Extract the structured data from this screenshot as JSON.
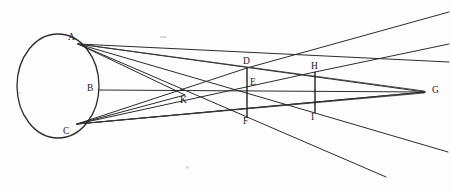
{
  "figure": {
    "type": "optical-ray-diagram",
    "background_color": "#fdfdfd",
    "ink_color": "#2b2b2b",
    "width": 451,
    "height": 190
  },
  "sphere": {
    "label": "luminous-sphere",
    "center_x": 58,
    "center_y": 86,
    "radius_x": 41,
    "radius_y": 52
  },
  "points": [
    {
      "id": "A",
      "label": "A",
      "x": 78,
      "y": 44,
      "label_x": 68,
      "label_y": 33
    },
    {
      "id": "B",
      "label": "B",
      "x": 98,
      "y": 90,
      "label_x": 87,
      "label_y": 84
    },
    {
      "id": "C",
      "label": "C",
      "x": 77,
      "y": 124,
      "label_x": 63,
      "label_y": 127
    },
    {
      "id": "K",
      "label": "K",
      "x": 185,
      "y": 95,
      "label_x": 180,
      "label_y": 96
    },
    {
      "id": "D",
      "label": "D",
      "x": 247,
      "y": 68,
      "label_x": 243,
      "label_y": 57
    },
    {
      "id": "E",
      "label": "E",
      "x": 248,
      "y": 90,
      "label_x": 250,
      "label_y": 78
    },
    {
      "id": "F",
      "label": "F",
      "x": 247,
      "y": 117,
      "label_x": 243,
      "label_y": 117
    },
    {
      "id": "H",
      "label": "H",
      "x": 315,
      "y": 72,
      "label_x": 311,
      "label_y": 62
    },
    {
      "id": "I",
      "label": "I",
      "x": 315,
      "y": 113,
      "label_x": 311,
      "label_y": 113
    },
    {
      "id": "G",
      "label": "G",
      "x": 425,
      "y": 92,
      "label_x": 432,
      "label_y": 86
    }
  ],
  "segments": [
    {
      "name": "segment-D-F",
      "x1": 247,
      "y1": 68,
      "x2": 247,
      "y2": 117
    },
    {
      "name": "segment-H-I",
      "x1": 315,
      "y1": 72,
      "x2": 315,
      "y2": 113
    }
  ],
  "axis": {
    "name": "optical-axis-B-G",
    "x1": 98,
    "y1": 90,
    "x2": 425,
    "y2": 92
  },
  "rays": [
    {
      "name": "ray-A-to-G",
      "x1": 78,
      "y1": 44,
      "x2": 425,
      "y2": 92
    },
    {
      "name": "ray-A-to-F",
      "x1": 78,
      "y1": 44,
      "x2": 247,
      "y2": 117
    },
    {
      "name": "ray-A-through-F-out",
      "x1": 247,
      "y1": 117,
      "x2": 386,
      "y2": 177
    },
    {
      "name": "ray-A-to-I",
      "x1": 78,
      "y1": 44,
      "x2": 315,
      "y2": 113
    },
    {
      "name": "ray-A-through-I-out",
      "x1": 315,
      "y1": 113,
      "x2": 448,
      "y2": 152
    },
    {
      "name": "ray-A-to-K",
      "x1": 78,
      "y1": 44,
      "x2": 185,
      "y2": 95
    },
    {
      "name": "ray-A-upper-edge",
      "x1": 78,
      "y1": 44,
      "x2": 449,
      "y2": 62
    },
    {
      "name": "ray-C-to-G",
      "x1": 77,
      "y1": 124,
      "x2": 425,
      "y2": 92
    },
    {
      "name": "ray-C-to-D",
      "x1": 77,
      "y1": 124,
      "x2": 247,
      "y2": 68
    },
    {
      "name": "ray-C-through-D-out",
      "x1": 247,
      "y1": 68,
      "x2": 449,
      "y2": 12
    },
    {
      "name": "ray-C-to-H",
      "x1": 77,
      "y1": 124,
      "x2": 315,
      "y2": 72
    },
    {
      "name": "ray-C-through-H-out",
      "x1": 315,
      "y1": 72,
      "x2": 449,
      "y2": 44
    },
    {
      "name": "ray-C-to-K",
      "x1": 77,
      "y1": 124,
      "x2": 185,
      "y2": 95
    },
    {
      "name": "ray-C-lower",
      "x1": 77,
      "y1": 124,
      "x2": 425,
      "y2": 92
    }
  ],
  "cross_rays": [
    {
      "name": "ray-A-lower-fan-1",
      "x1": 78,
      "y1": 44,
      "x2": 424,
      "y2": 91
    },
    {
      "name": "ray-C-upper-fan-1",
      "x1": 77,
      "y1": 124,
      "x2": 424,
      "y2": 93
    }
  ],
  "notes": {
    "converge_point": "G",
    "crossing_point": "K",
    "screen_near": "D-E-F",
    "screen_far": "H-I"
  }
}
